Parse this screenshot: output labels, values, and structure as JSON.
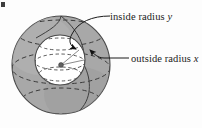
{
  "figure": {
    "name": "nested-spheres-diagram",
    "corner_mark": "",
    "background_color": "#fdfdfd",
    "outer_sphere": {
      "name": "outside sphere",
      "fill_color": "#a8a8a8",
      "stroke_color": "#4a4a4a",
      "center_x": 61,
      "center_y": 65,
      "radius": 49
    },
    "inner_sphere": {
      "name": "inside sphere",
      "fill_color": "#ffffff",
      "stroke_color": "#4a4a4a",
      "center_x": 60,
      "center_y": 60,
      "radius": 25
    },
    "center_dot": {
      "name": "center point",
      "x": 61,
      "y": 65,
      "color": "#606060"
    },
    "dash_color": "#3c3c3c",
    "leader_color": "#1b1b1b"
  },
  "labels": {
    "inside": {
      "text": "inside radius ",
      "variable": "y",
      "full": "inside radius y"
    },
    "outside": {
      "text": "outside radius ",
      "variable": "x",
      "full": "outside radius x"
    }
  }
}
